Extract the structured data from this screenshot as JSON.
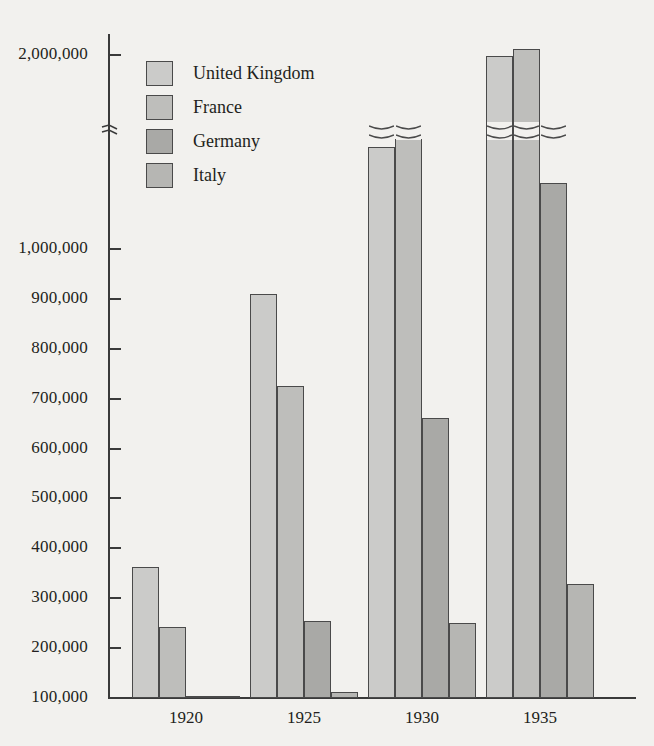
{
  "chart_data": {
    "type": "bar",
    "title": "",
    "xlabel": "",
    "ylabel": "",
    "categories": [
      "1920",
      "1925",
      "1930",
      "1935"
    ],
    "series": [
      {
        "name": "United Kingdom",
        "color": "#cbcbc9",
        "values": [
          365000,
          912000,
          1370000,
          2000000
        ]
      },
      {
        "name": "France",
        "color": "#bebebb",
        "values": [
          245000,
          727000,
          1425000,
          2050000
        ]
      },
      {
        "name": "Germany",
        "color": "#a9a9a6",
        "values": [
          75000,
          256000,
          663000,
          1120000
        ]
      },
      {
        "name": "Italy",
        "color": "#b6b6b3",
        "values": [
          45000,
          115000,
          252000,
          330000
        ]
      }
    ],
    "ytick_labels": [
      "2,000,000",
      "1,000,000",
      "900,000",
      "800,000",
      "700,000",
      "600,000",
      "500,000",
      "400,000",
      "300,000",
      "200,000",
      "100,000"
    ],
    "ytick_values": [
      2000000,
      1000000,
      900000,
      800000,
      700000,
      600000,
      500000,
      400000,
      300000,
      200000,
      100000
    ],
    "axis_break": true,
    "axis_break_between": [
      1000000,
      2000000
    ],
    "ylim": [
      0,
      2100000
    ],
    "grid": false,
    "legend_position": "top-left"
  },
  "legend": {
    "entries": [
      {
        "label": "United Kingdom"
      },
      {
        "label": "France"
      },
      {
        "label": "Germany"
      },
      {
        "label": "Italy"
      }
    ]
  }
}
